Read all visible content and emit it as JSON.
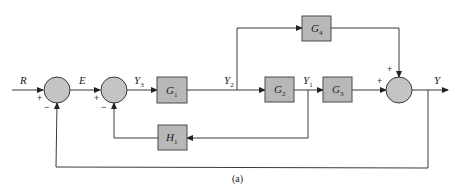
{
  "diagram": {
    "type": "control-system-block-diagram",
    "caption": "(a)",
    "signals": {
      "input": "R",
      "error": "E",
      "y3": {
        "base": "Y",
        "sub": "3"
      },
      "y2": {
        "base": "Y",
        "sub": "2"
      },
      "y1": {
        "base": "Y",
        "sub": "1"
      },
      "output": "Y"
    },
    "blocks": {
      "g1": {
        "base": "G",
        "sub": "1"
      },
      "g2": {
        "base": "G",
        "sub": "2"
      },
      "g3": {
        "base": "G",
        "sub": "3"
      },
      "g4": {
        "base": "G",
        "sub": "4"
      },
      "h1": {
        "base": "H",
        "sub": "1"
      }
    },
    "junctions": {
      "sum1": {
        "in_left": "+",
        "in_bottom": "−"
      },
      "sum2": {
        "in_left": "+",
        "in_bottom": "−"
      },
      "sum3": {
        "in_left": "+",
        "in_top": "+"
      }
    },
    "colors": {
      "block_fill": "#b8b8b8",
      "junction_fill": "#c4c4c4",
      "line": "#3a3a3a"
    }
  }
}
